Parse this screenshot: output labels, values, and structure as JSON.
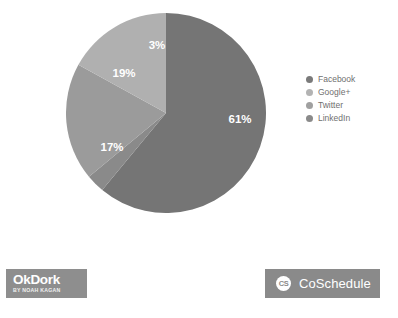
{
  "chart_data": {
    "type": "pie",
    "title": "",
    "categories": [
      "Facebook",
      "Google+",
      "Twitter",
      "LinkedIn"
    ],
    "values": [
      61,
      19,
      17,
      3
    ],
    "value_labels": [
      "61%",
      "19%",
      "17%",
      "3%"
    ],
    "units": "percent",
    "legend_position": "right",
    "grid": false,
    "start_angle_deg": 0,
    "direction": "clockwise",
    "slice_colors": [
      "#757575",
      "#9b9b9b",
      "#b0b0b0",
      "#8a8a8a"
    ],
    "label_color": "#ffffff",
    "slices": [
      {
        "name": "Facebook",
        "value": 61,
        "label": "61%",
        "color": "#757575",
        "label_x": 240,
        "label_y": 120
      },
      {
        "name": "LinkedIn",
        "value": 3,
        "label": "3%",
        "color": "#8a8a8a",
        "label_x": 157,
        "label_y": 46
      },
      {
        "name": "Google+",
        "value": 19,
        "label": "19%",
        "color": "#9b9b9b",
        "label_x": 124,
        "label_y": 74
      },
      {
        "name": "Twitter",
        "value": 17,
        "label": "17%",
        "color": "#b0b0b0",
        "label_x": 112,
        "label_y": 148
      }
    ]
  },
  "legend": {
    "items": [
      {
        "label": "Facebook",
        "color": "#7a7a7a"
      },
      {
        "label": "Google+",
        "color": "#b3b3b3"
      },
      {
        "label": "Twitter",
        "color": "#a0a0a0"
      },
      {
        "label": "LinkedIn",
        "color": "#8a8a8a"
      }
    ]
  },
  "footer": {
    "okdork": {
      "name": "OkDork",
      "tagline": "BY NOAH KAGAN",
      "background": "#8e8e8e"
    },
    "coschedule": {
      "badge": "CS",
      "name": "CoSchedule",
      "background": "#8a8a8a"
    }
  }
}
